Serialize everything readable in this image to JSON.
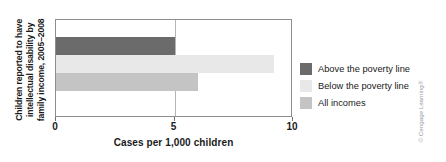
{
  "chart_data": {
    "type": "bar",
    "orientation": "horizontal",
    "title": "",
    "ylabel_lines": [
      "Children reported to have",
      "intellectual disability by",
      "family income, 2005–2008"
    ],
    "ylabel": "Children reported to have intellectual disability by family income, 2005–2008",
    "xlabel": "Cases per 1,000 children",
    "categories": [
      "Above the poverty line",
      "Below the poverty line",
      "All incomes"
    ],
    "values": [
      5.0,
      9.2,
      6.0
    ],
    "xlim": [
      0,
      10
    ],
    "xticks": [
      0,
      5,
      10
    ],
    "xtick_labels": [
      "0",
      "5",
      "10"
    ],
    "grid": "vertical-at-5",
    "legend_position": "right",
    "series": [
      {
        "name": "Above the poverty line",
        "value": 5.0,
        "color": "#6b6b6b"
      },
      {
        "name": "Below the poverty line",
        "value": 9.2,
        "color": "#e8e8e8"
      },
      {
        "name": "All incomes",
        "value": 6.0,
        "color": "#c4c4c4"
      }
    ]
  },
  "legend": {
    "items": [
      {
        "label": "Above the poverty line",
        "color": "#6b6b6b"
      },
      {
        "label": "Below the poverty line",
        "color": "#e8e8e8"
      },
      {
        "label": "All incomes",
        "color": "#c4c4c4"
      }
    ]
  },
  "credit": {
    "text": "© Cengage Learning®"
  },
  "colors": {
    "bar_above": "#6b6b6b",
    "bar_below": "#e8e8e8",
    "bar_all": "#c4c4c4",
    "frame": "#8d8d8d",
    "gridline": "#b5b5b5",
    "text": "#1a1a1a",
    "credit_text": "#9a9a9a",
    "background": "#ffffff"
  }
}
